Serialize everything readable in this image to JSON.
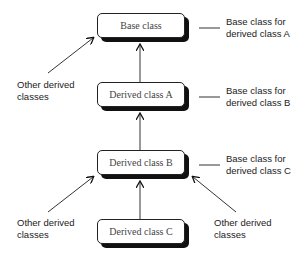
{
  "diagram": {
    "type": "class-inheritance-hierarchy",
    "boxes": [
      {
        "id": "base",
        "label": "Base class"
      },
      {
        "id": "derived_a",
        "label": "Derived class A"
      },
      {
        "id": "derived_b",
        "label": "Derived class B"
      },
      {
        "id": "derived_c",
        "label": "Derived class C"
      }
    ],
    "side_labels": [
      {
        "line1": "Base class for",
        "line2": "derived class A"
      },
      {
        "line1": "Base class for",
        "line2": "derived class B"
      },
      {
        "line1": "Base class for",
        "line2": "derived class C"
      }
    ],
    "other_labels": [
      {
        "line1": "Other derived",
        "line2": "classes"
      },
      {
        "line1": "Other derived",
        "line2": "classes"
      },
      {
        "line1": "Other derived",
        "line2": "classes"
      }
    ],
    "edges": [
      {
        "from": "derived_a",
        "to": "base"
      },
      {
        "from": "derived_b",
        "to": "derived_a"
      },
      {
        "from": "derived_c",
        "to": "derived_b"
      }
    ]
  }
}
